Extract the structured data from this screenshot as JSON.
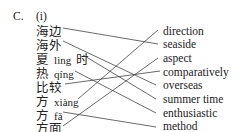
{
  "section_label": "C.",
  "sub_label": "(i)",
  "left_items": [
    {
      "zh": "海边",
      "py": "",
      "zh2": ""
    },
    {
      "zh": "海外",
      "py": "",
      "zh2": ""
    },
    {
      "zh": "夏",
      "py": "lìng",
      "zh2": "时"
    },
    {
      "zh": "热",
      "py": "qíng",
      "zh2": ""
    },
    {
      "zh": "比较",
      "py": "",
      "zh2": ""
    },
    {
      "zh": "方",
      "py": "xiàng",
      "zh2": ""
    },
    {
      "zh": "方",
      "py": "fǎ",
      "zh2": ""
    },
    {
      "zh": "方面",
      "py": "",
      "zh2": ""
    }
  ],
  "right_items": [
    "direction",
    "seaside",
    "aspect",
    "comparatively",
    "overseas",
    "summer time",
    "enthusiastic",
    "method"
  ],
  "matches": [
    {
      "left": 0,
      "right": 1
    },
    {
      "left": 1,
      "right": 4
    },
    {
      "left": 2,
      "right": 5
    },
    {
      "left": 3,
      "right": 6
    },
    {
      "left": 4,
      "right": 3
    },
    {
      "left": 5,
      "right": 0
    },
    {
      "left": 6,
      "right": 7
    },
    {
      "left": 7,
      "right": 2
    }
  ],
  "line_color": "#444444"
}
